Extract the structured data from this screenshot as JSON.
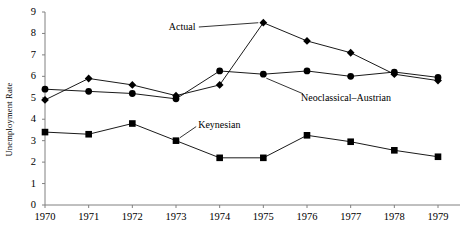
{
  "chart_data": {
    "type": "line",
    "title": "",
    "xlabel": "",
    "ylabel": "Unemployment Rate",
    "categories": [
      "1970",
      "1971",
      "1972",
      "1973",
      "1974",
      "1975",
      "1976",
      "1977",
      "1978",
      "1979"
    ],
    "x": [
      1970,
      1971,
      1972,
      1973,
      1974,
      1975,
      1976,
      1977,
      1978,
      1979
    ],
    "xlim": [
      1970,
      1979
    ],
    "ylim": [
      0,
      9
    ],
    "yticks": [
      0,
      1,
      2,
      3,
      4,
      5,
      6,
      7,
      8,
      9
    ],
    "grid": false,
    "legend_position": "inline-annotations",
    "series": [
      {
        "name": "Actual",
        "marker": "diamond",
        "values": [
          4.9,
          5.9,
          5.6,
          5.1,
          5.6,
          8.5,
          7.65,
          7.1,
          6.1,
          5.8
        ]
      },
      {
        "name": "Neoclassical–Austrian",
        "marker": "circle",
        "values": [
          5.4,
          5.3,
          5.2,
          4.95,
          6.25,
          6.1,
          6.25,
          6.0,
          6.2,
          5.95
        ]
      },
      {
        "name": "Keynesian",
        "marker": "square",
        "values": [
          3.4,
          3.3,
          3.8,
          3.0,
          2.2,
          2.2,
          3.25,
          2.95,
          2.55,
          2.25
        ]
      }
    ],
    "annotations": [
      {
        "text": "Actual",
        "x": 1973.5,
        "y": 8.3,
        "leader_to_x": 1975,
        "leader_to_y": 8.5
      },
      {
        "text": "Neoclassical–Austrian",
        "x": 1976.0,
        "y": 5.0,
        "leader_to_x": 1975,
        "leader_to_y": 6.1
      },
      {
        "text": "Keynesian",
        "x": 1973.6,
        "y": 3.75,
        "leader_to_x": 1973,
        "leader_to_y": 3.0
      }
    ],
    "colors": {
      "line": "#000000",
      "marker": "#000000",
      "axis": "#808080",
      "background": "#ffffff"
    }
  }
}
